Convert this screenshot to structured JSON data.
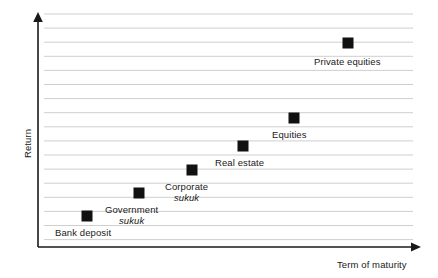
{
  "chart_data": {
    "type": "scatter",
    "title": "",
    "subtitle": "",
    "xlabel": "Term of maturity",
    "ylabel": "Return",
    "grid": true,
    "gridlines": 17,
    "legend": "none",
    "axis_style": "arrow-axes-no-ticks",
    "xlim": [
      0,
      10
    ],
    "ylim": [
      0,
      10
    ],
    "x_tick_labels": [],
    "y_tick_labels": [],
    "annotations": [
      "Bank deposit",
      "Government sukuk",
      "Corporate sukuk",
      "Real estate",
      "Equities",
      "Private equities"
    ],
    "points": [
      {
        "name": "Bank deposit",
        "label_line1": "Bank deposit",
        "label_line2": "",
        "x": 1.32,
        "y": 1.38,
        "px": 87,
        "py": 216,
        "label_px": 55,
        "label_py": 227,
        "label_align": "left"
      },
      {
        "name": "Government sukuk",
        "label_line1": "Government",
        "label_line2": "sukuk",
        "x": 2.69,
        "y": 2.33,
        "px": 139,
        "py": 193,
        "label_px": 105,
        "label_py": 204,
        "label_align": "left"
      },
      {
        "name": "Corporate sukuk",
        "label_line1": "Corporate",
        "label_line2": "sukuk",
        "x": 4.08,
        "y": 3.28,
        "px": 192,
        "py": 170,
        "label_px": 165,
        "label_py": 181,
        "label_align": "left"
      },
      {
        "name": "Real estate",
        "label_line1": "Real estate",
        "label_line2": "",
        "x": 5.42,
        "y": 4.26,
        "px": 243,
        "py": 146,
        "label_px": 215,
        "label_py": 157,
        "label_align": "left"
      },
      {
        "name": "Equities",
        "label_line1": "Equities",
        "label_line2": "",
        "x": 6.76,
        "y": 5.42,
        "px": 294,
        "py": 118,
        "label_px": 272,
        "label_py": 129,
        "label_align": "left"
      },
      {
        "name": "Private equities",
        "label_line1": "Private equities",
        "label_line2": "",
        "x": 8.18,
        "y": 8.54,
        "px": 348,
        "py": 43,
        "label_px": 314,
        "label_py": 56,
        "label_align": "left"
      }
    ],
    "marker": {
      "shape": "square",
      "size_px": 11,
      "color": "#111111"
    },
    "colors": {
      "marker": "#111111",
      "axis": "#1a1a1a",
      "gridline": "#cfcfcf",
      "text": "#1a1a1a",
      "background": "#ffffff"
    },
    "geometry": {
      "y_axis_x": 38,
      "y_axis_top": 13,
      "x_axis_y": 247,
      "x_axis_right": 421,
      "grid_left": 44,
      "grid_right": 413,
      "grid_top": 14,
      "grid_bottom": 240,
      "grid_spacing": 14.1
    }
  },
  "axes": {
    "x_title": "Term of maturity",
    "y_title": "Return",
    "x_title_px": 337,
    "x_title_py": 259,
    "y_title_px": 22,
    "y_title_py": 158
  }
}
